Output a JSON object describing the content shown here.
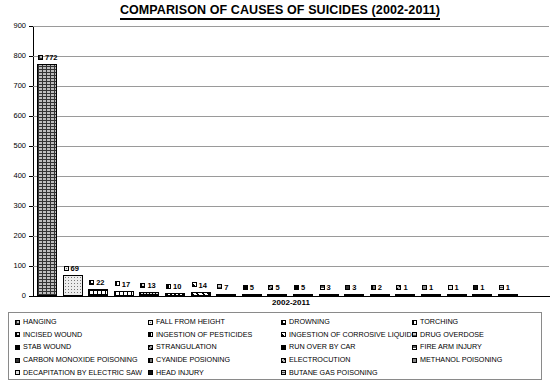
{
  "chart_data": {
    "type": "bar",
    "title": "COMPARISON OF CAUSES OF SUICIDES (2002-2011)",
    "xlabel": "2002-2011",
    "ylabel": "",
    "ylim": [
      0,
      900
    ],
    "ytick_step": 100,
    "yticks": [
      "900",
      "800",
      "700",
      "600",
      "500",
      "400",
      "300",
      "200",
      "100",
      "0"
    ],
    "grid": true,
    "legend_position": "bottom",
    "legend_columns": 4,
    "categories": [
      "HANGING",
      "FALL FROM HEIGHT",
      "DROWNING",
      "TORCHING",
      "INCISED WOUND",
      "INGESTION OF PESTICIDES",
      "INGESTION OF CORROSIVE LIQUID",
      "DRUG OVERDOSE",
      "STAB WOUND",
      "STRANGULATION",
      "RUN OVER BY CAR",
      "FIRE ARM INJURY",
      "CARBON MONOXIDE POISONING",
      "CYANIDE POSIONING",
      "ELECTROCUTION",
      "METHANOL POISONING",
      "DECAPITATION BY ELECTRIC SAW",
      "HEAD INJURY",
      "BUTANE GAS POISONING"
    ],
    "values": [
      772,
      69,
      22,
      17,
      13,
      10,
      14,
      7,
      5,
      5,
      5,
      3,
      3,
      2,
      1,
      1,
      1,
      1,
      1
    ]
  },
  "legend": {
    "items": [
      "HANGING",
      "FALL FROM HEIGHT",
      "DROWNING",
      "TORCHING",
      "INCISED WOUND",
      "INGESTION OF PESTICIDES",
      "INGESTION OF CORROSIVE LIQUID",
      "DRUG OVERDOSE",
      "STAB WOUND",
      "STRANGULATION",
      "RUN OVER BY CAR",
      "FIRE ARM INJURY",
      "CARBON MONOXIDE POISONING",
      "CYANIDE POSIONING",
      "ELECTROCUTION",
      "METHANOL POISONING",
      "DECAPITATION BY ELECTRIC SAW",
      "HEAD INJURY",
      "BUTANE GAS POISONING"
    ]
  },
  "colors": {
    "axis": "#000000",
    "gridline": "#9a9a9a",
    "background": "#ffffff",
    "legend_border": "#8a8a8a"
  }
}
